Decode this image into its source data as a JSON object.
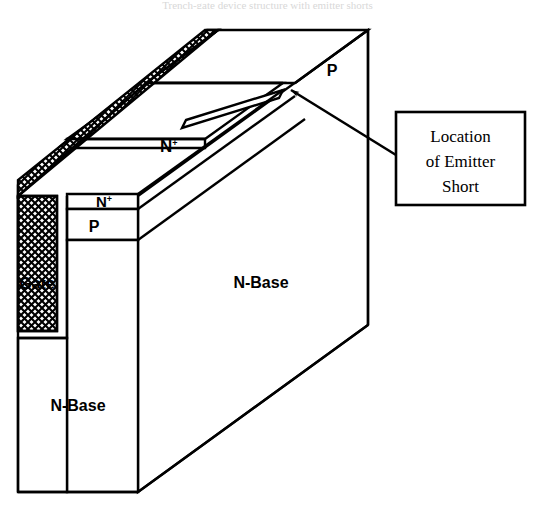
{
  "figure": {
    "caption_cropped": "Trench-gate device structure with emitter shorts",
    "type": "isometric-3d-cross-section"
  },
  "labels": {
    "gate": "Gate",
    "n_plus_top": "N",
    "n_plus_top_sup": "+",
    "n_plus_front": "N",
    "n_plus_front_sup": "+",
    "p_front": "P",
    "p_back": "P",
    "n_base_right": "N-Base",
    "n_base_left": "N-Base"
  },
  "callout": {
    "line1": "Location",
    "line2": "of Emitter",
    "line3": "Short",
    "arrow": "arrow-pointing-upper-left"
  },
  "colors": {
    "stroke": "#000000",
    "fill": "#ffffff",
    "hatch": "#000000",
    "background": "#ffffff"
  }
}
